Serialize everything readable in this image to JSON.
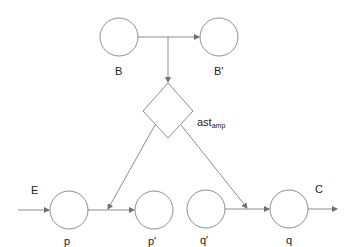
{
  "diagram": {
    "type": "petri-net",
    "stroke_color": "#707070",
    "places": [
      {
        "id": "B",
        "label": "B",
        "cx": 119,
        "cy": 37,
        "r": 19
      },
      {
        "id": "B'",
        "label": "B′",
        "cx": 219,
        "cy": 37,
        "r": 19
      },
      {
        "id": "p",
        "label": "p",
        "cx": 69,
        "cy": 210,
        "r": 19
      },
      {
        "id": "p'",
        "label": "p′",
        "cx": 154,
        "cy": 210,
        "r": 19
      },
      {
        "id": "q'",
        "label": "q′",
        "cx": 206,
        "cy": 209,
        "r": 19
      },
      {
        "id": "q",
        "label": "q",
        "cx": 289,
        "cy": 209,
        "r": 19
      }
    ],
    "transition": {
      "id": "ast_amp",
      "label_main": "ast",
      "label_sub": "amp"
    },
    "edges": [
      {
        "from": "B",
        "to": "B'"
      },
      {
        "from": "B-B' edge",
        "to": "ast_amp"
      },
      {
        "from": "ast_amp",
        "to": "p-p' edge"
      },
      {
        "from": "ast_amp",
        "to": "q'-q edge"
      },
      {
        "from": "E",
        "to": "p"
      },
      {
        "from": "p",
        "to": "p'"
      },
      {
        "from": "q'",
        "to": "q"
      },
      {
        "from": "q",
        "to": "C"
      }
    ],
    "external_labels": {
      "input": "E",
      "output": "C"
    }
  }
}
